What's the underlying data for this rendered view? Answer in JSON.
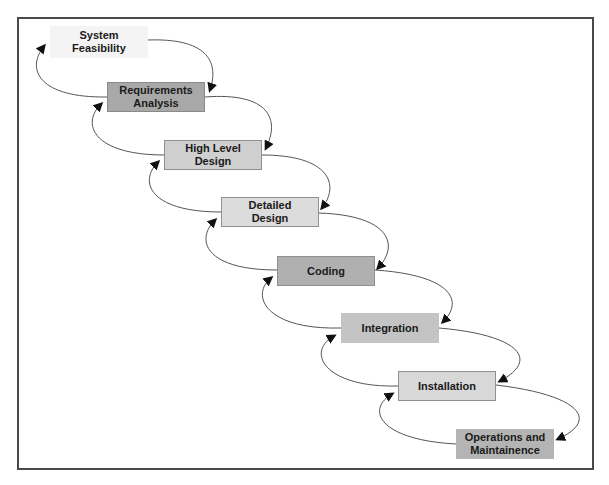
{
  "diagram": {
    "type": "waterfall-model",
    "stages": [
      {
        "id": "system-feasibility",
        "label": "System\nFeasibility",
        "x": 50,
        "y": 26,
        "h": 32,
        "fill": "#f4f4f4",
        "border": "#f4f4f4"
      },
      {
        "id": "requirements-analysis",
        "label": "Requirements\nAnalysis",
        "x": 107,
        "y": 82,
        "h": 30,
        "fill": "#a8a8a8",
        "border": "#8a8a8a"
      },
      {
        "id": "high-level-design",
        "label": "High Level\nDesign",
        "x": 164,
        "y": 140,
        "h": 30,
        "fill": "#cfcfcf",
        "border": "#909090"
      },
      {
        "id": "detailed-design",
        "label": "Detailed\nDesign",
        "x": 221,
        "y": 197,
        "h": 30,
        "fill": "#dcdcdc",
        "border": "#909090"
      },
      {
        "id": "coding",
        "label": "Coding",
        "x": 277,
        "y": 256,
        "h": 30,
        "fill": "#b0b0b0",
        "border": "#909090"
      },
      {
        "id": "integration",
        "label": "Integration",
        "x": 341,
        "y": 313,
        "h": 30,
        "fill": "#c4c4c4",
        "border": "#c4c4c4"
      },
      {
        "id": "installation",
        "label": "Installation",
        "x": 398,
        "y": 371,
        "h": 30,
        "fill": "#d8d8d8",
        "border": "#909090"
      },
      {
        "id": "operations-maintainence",
        "label": "Operations and\nMaintainence",
        "x": 456,
        "y": 429,
        "h": 30,
        "fill": "#b4b4b4",
        "border": "#b4b4b4"
      }
    ]
  }
}
